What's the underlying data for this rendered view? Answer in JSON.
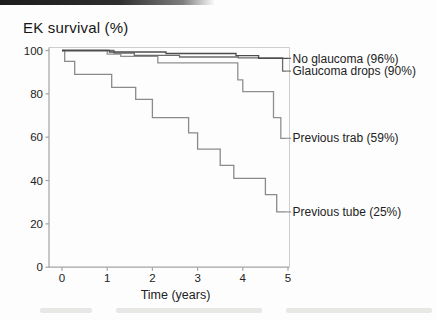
{
  "title": "EK survival (%)",
  "x_axis": {
    "label": "Time (years)",
    "ticks": [
      0,
      1,
      2,
      3,
      4,
      5
    ]
  },
  "y_axis": {
    "ticks": [
      100,
      80,
      60,
      40,
      20,
      0
    ]
  },
  "colors": {
    "axis": "#a3a3a3",
    "plot_border": "#cdcdcd",
    "tick_text": "#262626",
    "label_text": "#1f1f1f"
  },
  "chart_data": {
    "type": "line",
    "subtype": "kaplan-meier-step",
    "title": "EK survival (%)",
    "xlabel": "Time (years)",
    "ylabel": "EK survival (%)",
    "xlim": [
      0,
      5
    ],
    "ylim": [
      0,
      100
    ],
    "grid": false,
    "legend_position": "right-of-plot-inline",
    "series": [
      {
        "name": "No glaucoma",
        "label": "No glaucoma (96%)",
        "final_percent": 96,
        "color": "#4d4d4d",
        "end_x": 5.0,
        "steps": [
          [
            0,
            100
          ],
          [
            1.05,
            99.3
          ],
          [
            2.3,
            98.6
          ],
          [
            3.85,
            97.6
          ],
          [
            4.35,
            96.4
          ]
        ]
      },
      {
        "name": "Glaucoma drops",
        "label": "Glaucoma drops (90%)",
        "final_percent": 90,
        "color": "#6b6b6b",
        "end_x": 4.97,
        "steps": [
          [
            0,
            100
          ],
          [
            1.15,
            98.8
          ],
          [
            1.6,
            97.8
          ],
          [
            2.6,
            97.0
          ],
          [
            3.9,
            96.6
          ],
          [
            4.88,
            90.5
          ]
        ]
      },
      {
        "name": "Previous trab",
        "label": "Previous trab (59%)",
        "final_percent": 59,
        "color": "#8f8f8f",
        "end_x": 4.97,
        "steps": [
          [
            0,
            100
          ],
          [
            1.0,
            98.3
          ],
          [
            1.3,
            97.3
          ],
          [
            2.12,
            94.3
          ],
          [
            3.89,
            86.5
          ],
          [
            4.0,
            81
          ],
          [
            4.68,
            69
          ],
          [
            4.84,
            59.5
          ]
        ]
      },
      {
        "name": "Previous tube",
        "label": "Previous tube (25%)",
        "final_percent": 25,
        "color": "#8a8a8a",
        "end_x": 4.97,
        "steps": [
          [
            0,
            100
          ],
          [
            0.06,
            95
          ],
          [
            0.28,
            89
          ],
          [
            1.1,
            83
          ],
          [
            1.63,
            77.5
          ],
          [
            2.0,
            69
          ],
          [
            2.8,
            62
          ],
          [
            3.0,
            54.5
          ],
          [
            3.5,
            47
          ],
          [
            3.8,
            41
          ],
          [
            4.5,
            33.5
          ],
          [
            4.75,
            25.5
          ]
        ]
      }
    ]
  }
}
